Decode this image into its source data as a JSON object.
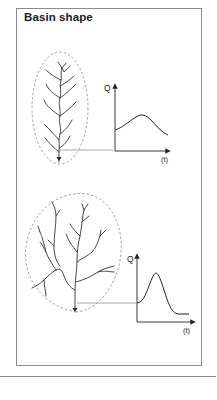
{
  "figure": {
    "title": "Basin shape",
    "colors": {
      "frame": "#8c8c8c",
      "stream": "#333333",
      "basin_outline": "#999999",
      "connector": "#aaaaaa",
      "axis": "#222222"
    }
  },
  "panels": [
    {
      "basin": "elongated",
      "hydrograph": {
        "y_label": "Q",
        "x_label": "(t)",
        "shape": "low, broad peak"
      }
    },
    {
      "basin": "round",
      "hydrograph": {
        "y_label": "Q",
        "x_label": "(t)",
        "shape": "high, sharp peak"
      }
    }
  ]
}
